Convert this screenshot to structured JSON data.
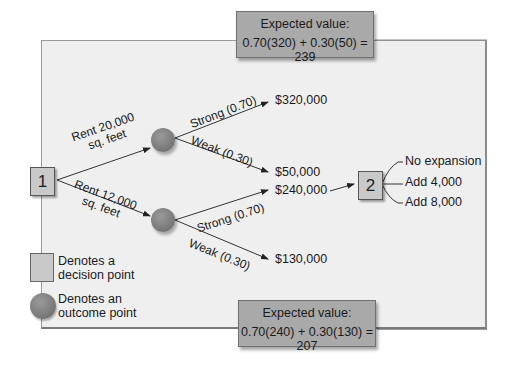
{
  "diagram": {
    "type": "decision-tree",
    "decision_points": [
      {
        "id": "1",
        "label": "1"
      },
      {
        "id": "2",
        "label": "2"
      }
    ],
    "branches": {
      "rent_20000": {
        "line1": "Rent  20,000",
        "line2": "sq. feet"
      },
      "rent_12000": {
        "line1": "Rent  12,000",
        "line2": "sq. feet"
      },
      "upper_strong": "Strong (0.70)",
      "upper_weak": "Weak (0.30)",
      "lower_strong": "Strong (0.70)",
      "lower_weak": "Weak (0.30)"
    },
    "payoffs": {
      "upper_strong": "$320,000",
      "upper_weak": "$50,000",
      "lower_strong": "$240,000",
      "lower_weak": "$130,000"
    },
    "second_decision_options": [
      "No expansion",
      "Add  4,000",
      "Add  8,000"
    ],
    "expected_values": {
      "top": {
        "title": "Expected value:",
        "formula": "0.70(320) + 0.30(50) = 239"
      },
      "bottom": {
        "title": "Expected value:",
        "formula": "0.70(240) + 0.30(130) = 207"
      }
    },
    "legend": {
      "decision": {
        "line1": "Denotes a",
        "line2": "decision point"
      },
      "outcome": {
        "line1": "Denotes an",
        "line2": "outcome point"
      }
    }
  }
}
